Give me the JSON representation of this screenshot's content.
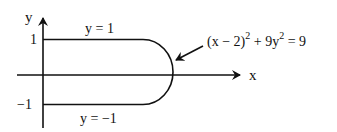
{
  "diagram": {
    "axes": {
      "x_label": "x",
      "y_label": "y",
      "tick_top": "1",
      "tick_bottom": "−1"
    },
    "curves": {
      "top_line_label": "y = 1",
      "bottom_line_label": "y = −1",
      "ellipse_label_base": "(x − 2)",
      "ellipse_label_sq1": "2",
      "ellipse_label_mid": " + 9y",
      "ellipse_label_sq2": "2",
      "ellipse_label_end": " = 9"
    },
    "colors": {
      "stroke": "#111111",
      "background": "#ffffff"
    }
  }
}
